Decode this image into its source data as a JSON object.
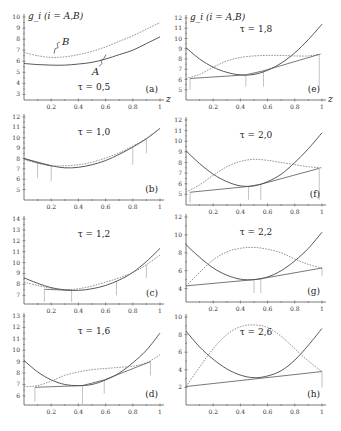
{
  "figure": {
    "y_label": "g_i  (i = A,B)",
    "x_label": "z"
  },
  "chart_data": [
    {
      "panel": "(a)",
      "tau_label": "τ = 0,5",
      "type": "line",
      "xlim": [
        0,
        1
      ],
      "ylim": [
        2.5,
        10
      ],
      "yticks": [
        3,
        4,
        5,
        6,
        7,
        8,
        9,
        10
      ],
      "xticks": [
        "0.2",
        "0.4",
        "0.6",
        "0.8",
        "1"
      ],
      "show_xticks_top": false,
      "show_z_label": true,
      "show_y_label": true,
      "series": [
        {
          "name": "A",
          "style": "solid",
          "x": [
            0,
            0.1,
            0.2,
            0.3,
            0.4,
            0.5,
            0.6,
            0.7,
            0.8,
            0.9,
            1.0
          ],
          "y": [
            5.8,
            5.7,
            5.65,
            5.65,
            5.75,
            5.9,
            6.2,
            6.6,
            7.0,
            7.6,
            8.2
          ]
        },
        {
          "name": "B",
          "style": "dashed",
          "x": [
            0,
            0.1,
            0.2,
            0.3,
            0.4,
            0.5,
            0.6,
            0.7,
            0.8,
            0.9,
            1.0
          ],
          "y": [
            6.8,
            6.5,
            6.35,
            6.4,
            6.6,
            6.9,
            7.3,
            7.8,
            8.3,
            8.9,
            9.5
          ]
        }
      ],
      "tangent": [],
      "drops": [],
      "annotations": [
        {
          "text": "B",
          "x": 0.28,
          "y": 7.5
        },
        {
          "text": "A",
          "x": 0.5,
          "y": 4.8
        }
      ]
    },
    {
      "panel": "(e)",
      "tau_label": "τ = 1,8",
      "type": "line",
      "xlim": [
        0,
        1
      ],
      "ylim": [
        4,
        12
      ],
      "yticks": [
        5,
        6,
        7,
        8,
        9,
        10,
        11,
        12
      ],
      "xticks": [
        "0.2",
        "0.4",
        "0.6",
        "0.8",
        "1"
      ],
      "show_xticks_top": false,
      "show_z_label": true,
      "show_y_label": true,
      "series": [
        {
          "name": "A",
          "style": "solid",
          "x": [
            0,
            0.1,
            0.2,
            0.3,
            0.4,
            0.5,
            0.6,
            0.7,
            0.8,
            0.9,
            1.0
          ],
          "y": [
            9.1,
            8.0,
            7.2,
            6.7,
            6.45,
            6.5,
            6.9,
            7.6,
            8.6,
            9.9,
            11.4
          ]
        },
        {
          "name": "B",
          "style": "dashed",
          "x": [
            0,
            0.1,
            0.2,
            0.3,
            0.4,
            0.5,
            0.6,
            0.7,
            0.8,
            0.9,
            1.0
          ],
          "y": [
            6.1,
            6.5,
            7.2,
            7.8,
            8.15,
            8.3,
            8.35,
            8.35,
            8.3,
            8.3,
            8.5
          ]
        }
      ],
      "tangent": [
        [
          0.03,
          6.1
        ],
        [
          0.44,
          6.45
        ],
        [
          0.57,
          6.85
        ],
        [
          0.98,
          8.45
        ]
      ],
      "drops": [
        [
          0.03,
          6.1,
          5.0
        ],
        [
          0.44,
          6.45,
          5.3
        ],
        [
          0.57,
          6.85,
          5.3
        ],
        [
          0.98,
          8.45,
          5.3
        ]
      ],
      "annotations": []
    },
    {
      "panel": "(b)",
      "tau_label": "τ = 1,0",
      "type": "line",
      "xlim": [
        0,
        1
      ],
      "ylim": [
        4,
        12
      ],
      "yticks": [
        5,
        6,
        7,
        8,
        9,
        10,
        11,
        12
      ],
      "xticks": [
        "0.2",
        "0.4",
        "0.6",
        "0.8",
        "1"
      ],
      "show_xticks_top": true,
      "show_z_label": false,
      "show_y_label": false,
      "series": [
        {
          "name": "A",
          "style": "solid",
          "x": [
            0,
            0.1,
            0.2,
            0.3,
            0.4,
            0.5,
            0.6,
            0.7,
            0.8,
            0.9,
            1.0
          ],
          "y": [
            8.0,
            7.6,
            7.3,
            7.1,
            7.15,
            7.4,
            7.8,
            8.4,
            9.1,
            9.9,
            10.9
          ]
        },
        {
          "name": "B",
          "style": "dashed",
          "x": [
            0,
            0.1,
            0.2,
            0.3,
            0.4,
            0.5,
            0.6,
            0.7,
            0.8,
            0.9,
            1.0
          ],
          "y": [
            7.9,
            7.55,
            7.3,
            7.3,
            7.4,
            7.65,
            8.05,
            8.55,
            9.2,
            9.95,
            10.9
          ]
        }
      ],
      "tangent": [
        [
          0.0,
          8.0
        ],
        [
          0.2,
          7.3
        ]
      ],
      "drops": [
        [
          0.1,
          7.6,
          6.1
        ],
        [
          0.2,
          7.3,
          5.8
        ],
        [
          0.8,
          9.1,
          7.4
        ],
        [
          0.9,
          9.9,
          8.5
        ]
      ],
      "annotations": []
    },
    {
      "panel": "(f)",
      "tau_label": "τ = 2,0",
      "type": "line",
      "xlim": [
        0,
        1
      ],
      "ylim": [
        4,
        12
      ],
      "yticks": [
        5,
        6,
        7,
        8,
        9,
        10,
        11,
        12
      ],
      "xticks": [
        "0.2",
        "0.4",
        "0.6",
        "0.8",
        "1"
      ],
      "show_xticks_top": true,
      "show_z_label": false,
      "show_y_label": false,
      "series": [
        {
          "name": "A",
          "style": "solid",
          "x": [
            0,
            0.1,
            0.2,
            0.3,
            0.4,
            0.5,
            0.6,
            0.7,
            0.8,
            0.9,
            1.0
          ],
          "y": [
            9.1,
            7.9,
            6.9,
            6.2,
            5.8,
            5.8,
            6.2,
            6.9,
            8.0,
            9.3,
            10.8
          ]
        },
        {
          "name": "B",
          "style": "dashed",
          "x": [
            0,
            0.1,
            0.2,
            0.3,
            0.4,
            0.5,
            0.6,
            0.7,
            0.8,
            0.9,
            1.0
          ],
          "y": [
            5.2,
            5.9,
            6.8,
            7.6,
            8.1,
            8.3,
            8.2,
            8.0,
            7.8,
            7.6,
            7.5
          ]
        }
      ],
      "tangent": [
        [
          0.03,
          5.2
        ],
        [
          0.46,
          5.75
        ],
        [
          0.55,
          5.95
        ],
        [
          0.98,
          7.45
        ]
      ],
      "drops": [
        [
          0.03,
          5.2,
          4.2
        ],
        [
          0.46,
          5.75,
          4.5
        ],
        [
          0.55,
          5.95,
          4.5
        ],
        [
          0.98,
          7.45,
          4.5
        ]
      ],
      "annotations": []
    },
    {
      "panel": "(c)",
      "tau_label": "τ = 1,2",
      "type": "line",
      "xlim": [
        0,
        1
      ],
      "ylim": [
        6.2,
        14
      ],
      "yticks": [
        7,
        8,
        9,
        10,
        11,
        12,
        13,
        14
      ],
      "xticks": [
        "0.2",
        "0.4",
        "0.6",
        "0.8",
        "1"
      ],
      "show_xticks_top": true,
      "show_z_label": false,
      "show_y_label": false,
      "series": [
        {
          "name": "A",
          "style": "solid",
          "x": [
            0,
            0.1,
            0.2,
            0.3,
            0.4,
            0.5,
            0.6,
            0.7,
            0.8,
            0.9,
            1.0
          ],
          "y": [
            8.6,
            8.1,
            7.7,
            7.5,
            7.45,
            7.6,
            7.9,
            8.4,
            9.1,
            10.1,
            11.3
          ]
        },
        {
          "name": "B",
          "style": "dashed",
          "x": [
            0,
            0.1,
            0.2,
            0.3,
            0.4,
            0.5,
            0.6,
            0.7,
            0.8,
            0.9,
            1.0
          ],
          "y": [
            8.2,
            7.9,
            7.65,
            7.5,
            7.6,
            7.85,
            8.2,
            8.6,
            9.1,
            9.8,
            10.7
          ]
        }
      ],
      "tangent": [
        [
          0.15,
          7.55
        ],
        [
          0.35,
          7.45
        ]
      ],
      "drops": [
        [
          0.15,
          7.55,
          6.4
        ],
        [
          0.35,
          7.45,
          6.4
        ],
        [
          0.68,
          8.3,
          7.0
        ],
        [
          0.9,
          9.8,
          8.6
        ]
      ],
      "annotations": []
    },
    {
      "panel": "(g)",
      "tau_label": "τ = 2,2",
      "type": "line",
      "xlim": [
        0,
        1
      ],
      "ylim": [
        2.5,
        12
      ],
      "yticks": [
        4,
        6,
        8,
        10,
        12
      ],
      "xticks": [
        "0.2",
        "0.4",
        "0.6",
        "0.8",
        "1"
      ],
      "show_xticks_top": true,
      "show_z_label": false,
      "show_y_label": false,
      "series": [
        {
          "name": "A",
          "style": "solid",
          "x": [
            0,
            0.1,
            0.2,
            0.3,
            0.4,
            0.5,
            0.6,
            0.7,
            0.8,
            0.9,
            1.0
          ],
          "y": [
            8.9,
            7.5,
            6.3,
            5.5,
            5.05,
            5.0,
            5.3,
            6.0,
            7.1,
            8.5,
            10.3
          ]
        },
        {
          "name": "B",
          "style": "dashed",
          "x": [
            0,
            0.1,
            0.2,
            0.3,
            0.4,
            0.5,
            0.6,
            0.7,
            0.8,
            0.9,
            1.0
          ],
          "y": [
            4.3,
            5.8,
            7.2,
            8.1,
            8.5,
            8.6,
            8.4,
            8.0,
            7.3,
            6.7,
            6.3
          ]
        }
      ],
      "tangent": [
        [
          0.0,
          4.3
        ],
        [
          0.5,
          5.0
        ],
        [
          0.55,
          5.1
        ],
        [
          1.0,
          6.3
        ]
      ],
      "drops": [
        [
          0.5,
          5.0,
          3.5
        ],
        [
          0.55,
          5.1,
          3.5
        ],
        [
          1.0,
          6.3,
          5.4
        ]
      ],
      "annotations": []
    },
    {
      "panel": "(d)",
      "tau_label": "τ = 1,6",
      "type": "line",
      "xlim": [
        0,
        1
      ],
      "ylim": [
        5.2,
        13
      ],
      "yticks": [
        6,
        7,
        8,
        9,
        10,
        11,
        12,
        13
      ],
      "xticks": [
        "0.2",
        "0.4",
        "0.6",
        "0.8",
        "1"
      ],
      "show_xticks_top": true,
      "show_z_label": false,
      "show_y_label": false,
      "series": [
        {
          "name": "A",
          "style": "solid",
          "x": [
            0,
            0.1,
            0.2,
            0.3,
            0.4,
            0.5,
            0.6,
            0.7,
            0.8,
            0.9,
            1.0
          ],
          "y": [
            9.1,
            8.1,
            7.4,
            7.0,
            6.9,
            7.0,
            7.4,
            8.0,
            8.9,
            10.0,
            11.5
          ]
        },
        {
          "name": "B",
          "style": "dashed",
          "x": [
            0,
            0.1,
            0.2,
            0.3,
            0.4,
            0.5,
            0.6,
            0.7,
            0.8,
            0.9,
            1.0
          ],
          "y": [
            6.8,
            6.9,
            7.3,
            7.8,
            8.1,
            8.3,
            8.4,
            8.5,
            8.6,
            8.9,
            9.6
          ]
        }
      ],
      "tangent": [
        [
          0.08,
          6.75
        ],
        [
          0.43,
          6.9
        ],
        [
          0.59,
          7.4
        ],
        [
          0.93,
          9.0
        ]
      ],
      "drops": [
        [
          0.08,
          6.75,
          5.5
        ],
        [
          0.43,
          6.9,
          5.3
        ],
        [
          0.59,
          7.4,
          6.2
        ],
        [
          0.93,
          9.0,
          7.8
        ]
      ],
      "annotations": []
    },
    {
      "panel": "(h)",
      "tau_label": "τ = 2,6",
      "type": "line",
      "xlim": [
        0,
        1
      ],
      "ylim": [
        0,
        10
      ],
      "yticks": [
        2,
        4,
        6,
        8,
        10
      ],
      "xticks": [
        "0.2",
        "0.4",
        "0.6",
        "0.8",
        "1"
      ],
      "show_xticks_top": true,
      "show_z_label": false,
      "show_y_label": false,
      "series": [
        {
          "name": "A",
          "style": "solid",
          "x": [
            0,
            0.1,
            0.2,
            0.3,
            0.4,
            0.5,
            0.6,
            0.7,
            0.8,
            0.9,
            1.0
          ],
          "y": [
            8.4,
            6.6,
            5.2,
            4.1,
            3.4,
            3.1,
            3.3,
            3.9,
            5.1,
            6.8,
            8.7
          ]
        },
        {
          "name": "B",
          "style": "dashed",
          "x": [
            0,
            0.1,
            0.2,
            0.3,
            0.4,
            0.5,
            0.6,
            0.7,
            0.8,
            0.9,
            1.0
          ],
          "y": [
            2.1,
            4.3,
            6.4,
            8.0,
            8.9,
            9.1,
            8.8,
            7.8,
            6.4,
            5.0,
            3.8
          ]
        }
      ],
      "tangent": [
        [
          0.0,
          2.1
        ],
        [
          1.0,
          3.8
        ]
      ],
      "drops": [
        [
          1.0,
          3.8,
          2.0
        ]
      ],
      "annotations": []
    }
  ]
}
